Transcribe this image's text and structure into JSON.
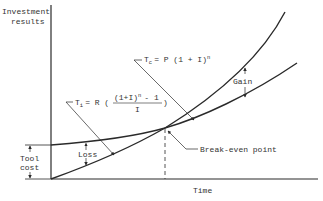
{
  "diagram": {
    "type": "investment-break-even-chart",
    "y_axis_label": [
      "Investment",
      "results"
    ],
    "x_axis_label": "Time",
    "tool_cost_label": [
      "Tool",
      "cost"
    ],
    "curves": [
      {
        "id": "T_C",
        "formula_lhs": "T",
        "formula_sub": "c",
        "formula_rhs": "= P (1 + I)",
        "formula_sup": "n",
        "description": "Compound growth curve starting at origin"
      },
      {
        "id": "T_I",
        "formula_lhs": "T",
        "formula_sub": "i",
        "formula_rhs_prefix": "= R (",
        "formula_numerator": "(1+I)",
        "formula_numerator_sup": "n",
        "formula_numerator_tail": "- 1",
        "formula_denominator": "I",
        "formula_rhs_suffix": ")",
        "description": "Annuity curve starting at tool cost"
      }
    ],
    "annotations": {
      "gain": "Gain",
      "loss": "Loss",
      "break_even": "Break-even point"
    },
    "colors": {
      "line": "#2a2a2a",
      "text": "#333333",
      "background": "#ffffff"
    }
  }
}
